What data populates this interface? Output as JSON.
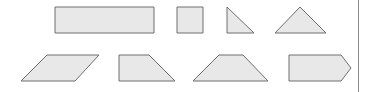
{
  "diagram": {
    "type": "geometric-shapes-set",
    "colors": {
      "fill": "#e8e8e8",
      "stroke": "#6e6e6e",
      "divider": "#8a8a8a",
      "background": "#ffffff"
    },
    "rows": [
      {
        "shapes": [
          {
            "name": "rectangle",
            "points": "55,7 154,7 154,33 55,33"
          },
          {
            "name": "square",
            "points": "177,7 203,7 203,33 177,33"
          },
          {
            "name": "right-triangle",
            "points": "227,7 227,33 254,33"
          },
          {
            "name": "isosceles-triangle",
            "points": "275,33 300,7 326,33"
          }
        ]
      },
      {
        "shapes": [
          {
            "name": "parallelogram",
            "points": "21,81 47,55 99,55 75,81"
          },
          {
            "name": "right-trapezoid",
            "points": "119,55 149,55 175,81 119,81"
          },
          {
            "name": "isosceles-trapezoid",
            "points": "193,81 219,55 243,55 268,81"
          },
          {
            "name": "pentagon-arrow",
            "points": "289,55 341,55 351,68 341,81 289,81"
          }
        ]
      }
    ],
    "divider": {
      "x": 358,
      "y1": 0,
      "y2": 92
    }
  }
}
